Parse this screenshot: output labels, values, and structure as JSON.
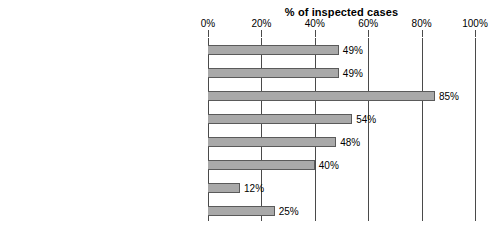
{
  "chart_data": {
    "type": "bar",
    "orientation": "horizontal",
    "title": "% of inspected cases",
    "xlabel": "",
    "ylabel": "",
    "xlim": [
      0,
      100
    ],
    "xticks": [
      "0%",
      "20%",
      "40%",
      "60%",
      "80%",
      "100%"
    ],
    "xtick_values": [
      0,
      20,
      40,
      60,
      80,
      100
    ],
    "grid": true,
    "legend": false,
    "categories": [
      "Attitudes to offending",
      "Family and relationships",
      "Thinking and behaviour",
      "Lifestyle, including friends and associates",
      "Drug misuse",
      "Alcohol misuse",
      "Education, training and employment",
      "Accommodation"
    ],
    "values": [
      49,
      49,
      85,
      54,
      48,
      40,
      12,
      25
    ],
    "value_labels": [
      "49%",
      "49%",
      "85%",
      "54%",
      "48%",
      "40%",
      "12%",
      "25%"
    ],
    "colors": {
      "bar_fill": "#a9a9a9",
      "bar_border": "#5a5a5a",
      "gridline": "#4a4a4a",
      "text": "#000000",
      "background": "#ffffff"
    }
  }
}
